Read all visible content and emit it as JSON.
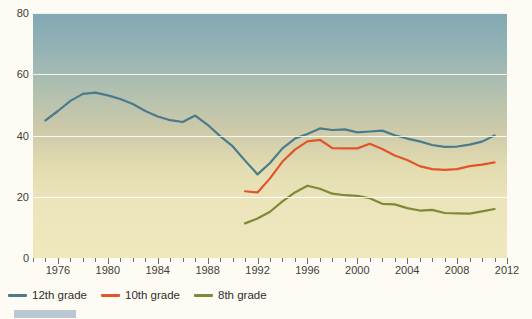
{
  "figure": {
    "title_clipped": "",
    "background": "#fdfbf4",
    "footer_bar_color": "#b9c8d2"
  },
  "axes": {
    "y_ticks": [
      {
        "value": 80,
        "label": "80"
      },
      {
        "value": 60,
        "label": "60"
      },
      {
        "value": 40,
        "label": "40"
      },
      {
        "value": 20,
        "label": "20"
      },
      {
        "value": 0,
        "label": "0"
      }
    ],
    "x_tick_labels": [
      "1976",
      "1980",
      "1984",
      "1988",
      "1992",
      "1996",
      "2000",
      "2004",
      "2008",
      "2012"
    ],
    "x_min": 1974,
    "x_max": 2012,
    "y_min": 0,
    "y_max": 80,
    "gridlines": true
  },
  "legend": {
    "position": "below-axis-left",
    "items": [
      {
        "label": "12th grade",
        "color": "#4a7b8c"
      },
      {
        "label": "10th grade",
        "color": "#e2542a"
      },
      {
        "label": "8th grade",
        "color": "#7d8a37"
      }
    ]
  },
  "chart_data": {
    "type": "line",
    "title": "",
    "xlabel": "",
    "ylabel": "",
    "xlim": [
      1974,
      2012
    ],
    "ylim": [
      0,
      80
    ],
    "grid": true,
    "legend_position": "bottom-left",
    "series": [
      {
        "name": "12th grade",
        "color": "#4a7b8c",
        "x": [
          1975,
          1976,
          1977,
          1978,
          1979,
          1980,
          1981,
          1982,
          1983,
          1984,
          1985,
          1986,
          1987,
          1988,
          1989,
          1990,
          1991,
          1992,
          1993,
          1994,
          1995,
          1996,
          1997,
          1998,
          1999,
          2000,
          2001,
          2002,
          2003,
          2004,
          2005,
          2006,
          2007,
          2008,
          2009,
          2010,
          2011
        ],
        "y": [
          44.9,
          48.0,
          51.3,
          53.6,
          54.0,
          53.1,
          51.9,
          50.3,
          48.0,
          46.2,
          45.0,
          44.4,
          46.5,
          43.5,
          39.8,
          36.5,
          31.8,
          27.3,
          31.0,
          35.8,
          39.0,
          40.5,
          42.3,
          41.8,
          42.0,
          41.0,
          41.3,
          41.6,
          40.1,
          39.0,
          38.1,
          36.9,
          36.3,
          36.4,
          37.0,
          38.0,
          40.0
        ]
      },
      {
        "name": "10th grade",
        "color": "#e2542a",
        "x": [
          1991,
          1992,
          1993,
          1994,
          1995,
          1996,
          1997,
          1998,
          1999,
          2000,
          2001,
          2002,
          2003,
          2004,
          2005,
          2006,
          2007,
          2008,
          2009,
          2010,
          2011
        ],
        "y": [
          21.8,
          21.4,
          26.0,
          31.5,
          35.4,
          38.1,
          38.6,
          35.9,
          35.8,
          35.8,
          37.3,
          35.6,
          33.5,
          32.0,
          30.0,
          29.0,
          28.8,
          29.0,
          30.0,
          30.5,
          31.2
        ]
      },
      {
        "name": "8th grade",
        "color": "#7d8a37",
        "x": [
          1991,
          1992,
          1993,
          1994,
          1995,
          1996,
          1997,
          1998,
          1999,
          2000,
          2001,
          2002,
          2003,
          2004,
          2005,
          2006,
          2007,
          2008,
          2009,
          2010,
          2011
        ],
        "y": [
          11.3,
          12.9,
          15.1,
          18.5,
          21.4,
          23.6,
          22.6,
          21.0,
          20.5,
          20.3,
          19.5,
          17.7,
          17.5,
          16.3,
          15.5,
          15.7,
          14.7,
          14.6,
          14.5,
          15.2,
          16.0
        ]
      }
    ]
  }
}
